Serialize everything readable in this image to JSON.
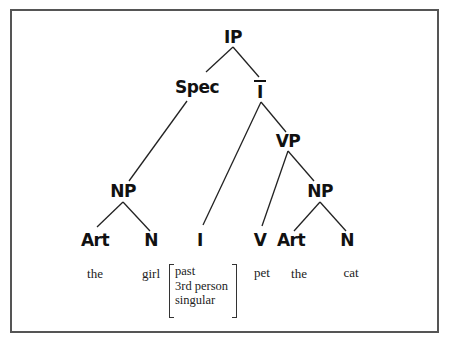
{
  "tree": {
    "nodes": {
      "ip": "IP",
      "spec": "Spec",
      "ibar": "I",
      "vp": "VP",
      "np_subject": "NP",
      "i_head": "I",
      "np_object": "NP",
      "art_subject": "Art",
      "n_subject": "N",
      "v": "V",
      "art_object": "Art",
      "n_object": "N"
    },
    "words": {
      "the_subject": "the",
      "girl": "girl",
      "pet": "pet",
      "the_object": "the",
      "cat": "cat"
    },
    "features": [
      "past",
      "3rd person",
      "singular"
    ]
  }
}
